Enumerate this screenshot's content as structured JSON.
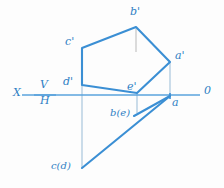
{
  "figure": {
    "type": "descriptive-geometry-projection-diagram",
    "colors": {
      "line": "#3b8fd4",
      "line_dark": "#2f7fc4",
      "thin_line": "#a9c6dd",
      "axis": "#5aa3dc",
      "background": "#fdfdfd",
      "label": "#2f7fc4"
    },
    "axis": {
      "y": 95,
      "x_start": 22,
      "x_end": 200,
      "left_label": "X",
      "right_label": "0",
      "upper_plane_label": "V",
      "lower_plane_label": "H",
      "divider_x1": 36,
      "divider_x2": 58
    },
    "frontal_view": {
      "name": "V-projection (front view)",
      "vertices": [
        {
          "id": "a-prime",
          "label": "a'",
          "x": 170,
          "y": 62
        },
        {
          "id": "b-prime",
          "label": "b'",
          "x": 136,
          "y": 27
        },
        {
          "id": "c-prime",
          "label": "c'",
          "x": 82,
          "y": 48
        },
        {
          "id": "d-prime",
          "label": "d'",
          "x": 82,
          "y": 85
        },
        {
          "id": "e-prime",
          "label": "e'",
          "x": 137,
          "y": 93
        }
      ],
      "edges": [
        [
          "b-prime",
          "c-prime"
        ],
        [
          "c-prime",
          "d-prime"
        ],
        [
          "d-prime",
          "e-prime"
        ],
        [
          "e-prime",
          "a-prime"
        ],
        [
          "a-prime",
          "b-prime"
        ]
      ]
    },
    "horizontal_view": {
      "name": "H-projection (top view)",
      "vertices": [
        {
          "id": "a",
          "label": "a",
          "x": 170,
          "y": 96
        },
        {
          "id": "be",
          "label": "b(e)",
          "x": 137,
          "y": 112
        },
        {
          "id": "cd",
          "label": "c(d)",
          "x": 82,
          "y": 168
        }
      ],
      "edges": [
        [
          "a",
          "cd"
        ],
        [
          "a",
          "be"
        ]
      ]
    },
    "projection_lines": [
      {
        "from": "c-prime",
        "x": 82,
        "y1": 48,
        "y2": 168,
        "style": "thin"
      },
      {
        "from": "a-prime",
        "x": 170,
        "y1": 62,
        "y2": 96,
        "style": "thin"
      },
      {
        "from": "e-prime",
        "x": 137,
        "y1": 93,
        "y2": 113,
        "style": "thin"
      },
      {
        "from": "b-prime",
        "x": 136,
        "y1": 29,
        "y2": 52,
        "style": "faint"
      }
    ],
    "labels": [
      {
        "id": "label-b-prime",
        "text": "b'",
        "x": 130,
        "y": 8
      },
      {
        "id": "label-c-prime",
        "text": "c'",
        "x": 66,
        "y": 38
      },
      {
        "id": "label-a-prime",
        "text": "a'",
        "x": 175,
        "y": 52
      },
      {
        "id": "label-d-prime",
        "text": "d'",
        "x": 64,
        "y": 78
      },
      {
        "id": "label-e-prime",
        "text": "e'",
        "x": 128,
        "y": 82
      },
      {
        "id": "label-a",
        "text": "a",
        "x": 173,
        "y": 98
      },
      {
        "id": "label-be",
        "text": "b(e)",
        "x": 112,
        "y": 110
      },
      {
        "id": "label-cd",
        "text": "c(d)",
        "x": 52,
        "y": 162
      },
      {
        "id": "label-x",
        "text": "X",
        "x": 14,
        "y": 88
      },
      {
        "id": "label-v",
        "text": "V",
        "x": 40,
        "y": 80
      },
      {
        "id": "label-h",
        "text": "H",
        "x": 40,
        "y": 96
      },
      {
        "id": "label-zero",
        "text": "0",
        "x": 204,
        "y": 86
      }
    ]
  }
}
